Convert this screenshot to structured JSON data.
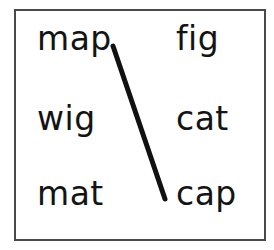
{
  "worksheet": {
    "type": "word-matching-exercise",
    "frame": {
      "border_color": "#4a4a4a",
      "background_color": "#ffffff"
    },
    "text_color": "#141414",
    "columns": {
      "left": {
        "words": [
          {
            "text": "map",
            "row": 1
          },
          {
            "text": "wig",
            "row": 2
          },
          {
            "text": "mat",
            "row": 3
          }
        ]
      },
      "right": {
        "words": [
          {
            "text": "fig",
            "row": 1
          },
          {
            "text": "cat",
            "row": 2
          },
          {
            "text": "cap",
            "row": 3
          }
        ]
      }
    },
    "connections": [
      {
        "from": "map",
        "to": "cap",
        "stroke_color": "#111111",
        "stroke_width": 5,
        "x1": 113,
        "y1": 46,
        "x2": 165,
        "y2": 199
      }
    ]
  }
}
